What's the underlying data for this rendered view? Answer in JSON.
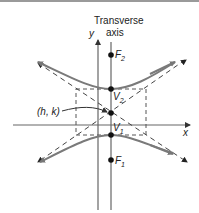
{
  "diagram": {
    "title_line1": "Transverse",
    "title_line2": "axis",
    "y_axis_label": "y",
    "x_axis_label": "x",
    "center_label": "(h, k)",
    "points": [
      {
        "name": "F",
        "sub": "2",
        "x": 111,
        "y": 55
      },
      {
        "name": "V",
        "sub": "2",
        "x": 111,
        "y": 89
      },
      {
        "name": "center",
        "x": 111,
        "y": 113
      },
      {
        "name": "V",
        "sub": "1",
        "x": 111,
        "y": 135
      },
      {
        "name": "F",
        "sub": "1",
        "x": 111,
        "y": 160
      }
    ],
    "colors": {
      "curve": "#7a7a7a",
      "lines": "#555555",
      "points": "#111111",
      "top_bar": "#9a9a9a"
    }
  }
}
